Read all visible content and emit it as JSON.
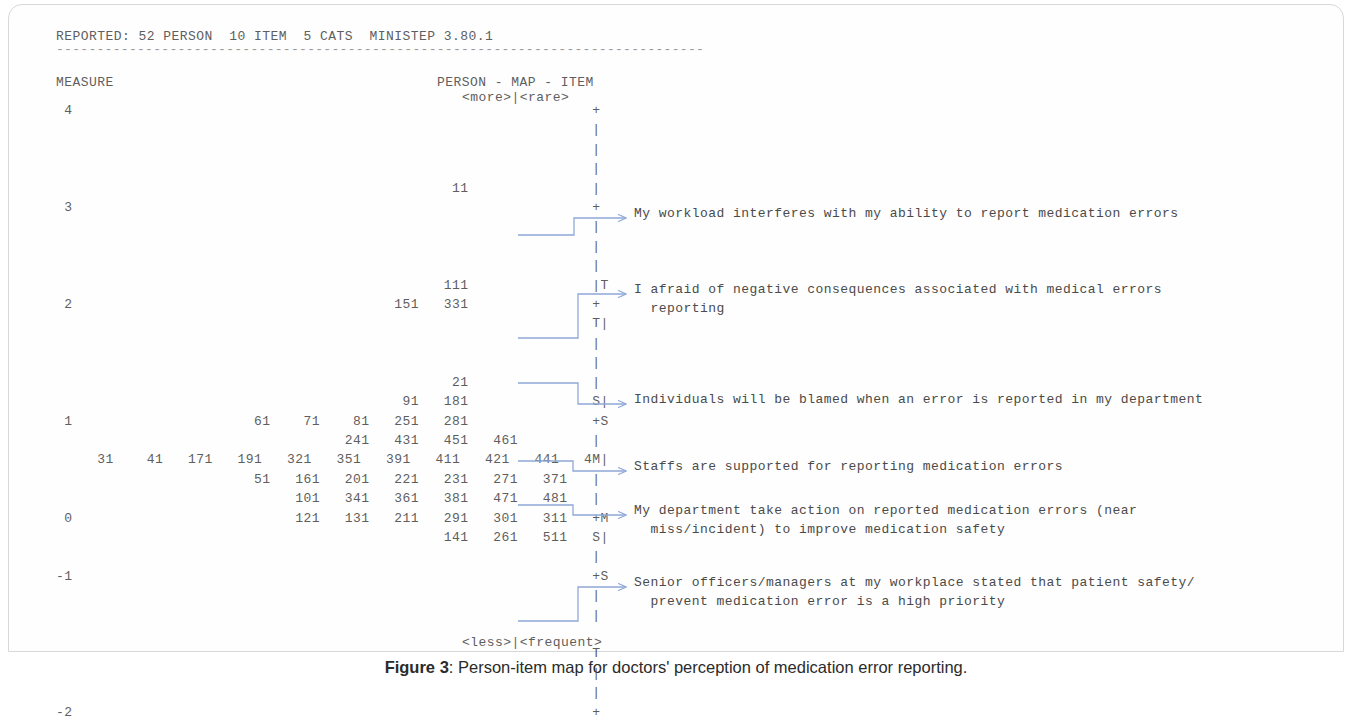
{
  "header": {
    "reported_line": "REPORTED: 52 PERSON  10 ITEM  5 CATS  MINISTEP 3.80.1",
    "rule": "--------------------------------------------------------------------------------",
    "measure_label": "MEASURE",
    "map_title": "PERSON - MAP - ITEM",
    "top_legend": "<more>|<rare>",
    "bottom_legend": "<less>|<frequent>"
  },
  "axis": {
    "ticks": [
      "4",
      "3",
      "2",
      "1",
      "0",
      "-1",
      "-2"
    ]
  },
  "connector_color": "#8fa8d8",
  "map_rows": [
    {
      "measure": "4",
      "persons": "",
      "marker": "+"
    },
    {
      "measure": "",
      "persons": "",
      "marker": "|"
    },
    {
      "measure": "",
      "persons": "",
      "marker": "|"
    },
    {
      "measure": "",
      "persons": "",
      "marker": "|"
    },
    {
      "measure": "",
      "persons": "                                             11",
      "marker": "|"
    },
    {
      "measure": "3",
      "persons": "",
      "marker": "+"
    },
    {
      "measure": "",
      "persons": "",
      "marker": "|"
    },
    {
      "measure": "",
      "persons": "",
      "marker": "|"
    },
    {
      "measure": "",
      "persons": "",
      "marker": "|"
    },
    {
      "measure": "",
      "persons": "                                            111",
      "marker": "|T"
    },
    {
      "measure": "2",
      "persons": "                                      151   331",
      "marker": "+"
    },
    {
      "measure": "",
      "persons": "",
      "marker": "T|"
    },
    {
      "measure": "",
      "persons": "",
      "marker": "|"
    },
    {
      "measure": "",
      "persons": "",
      "marker": "|"
    },
    {
      "measure": "",
      "persons": "                                             21",
      "marker": "|"
    },
    {
      "measure": "",
      "persons": "                                       91   181",
      "marker": "S|"
    },
    {
      "measure": "1",
      "persons": "                     61    71    81   251   281",
      "marker": "+S"
    },
    {
      "measure": "",
      "persons": "                                241   431   451   461",
      "marker": "|"
    },
    {
      "measure": "",
      "persons": "  31    41   171   191   321   351   391   411   421   441   491",
      "marker": "M|"
    },
    {
      "measure": "",
      "persons": "                     51   161   201   221   231   271   371   501",
      "marker": "|"
    },
    {
      "measure": "",
      "persons": "                          101   341   361   381   471   481   671",
      "marker": "|"
    },
    {
      "measure": "0",
      "persons": "                          121   131   211   291   301   311   401",
      "marker": "+M"
    },
    {
      "measure": "",
      "persons": "                                            141   261   511",
      "marker": "S|"
    },
    {
      "measure": "",
      "persons": "",
      "marker": "|"
    },
    {
      "measure": "-1",
      "persons": "",
      "marker": "+S"
    },
    {
      "measure": "",
      "persons": "",
      "marker": "|"
    },
    {
      "measure": "",
      "persons": "",
      "marker": "|"
    },
    {
      "measure": "",
      "persons": "",
      "marker": ""
    },
    {
      "measure": "",
      "persons": "",
      "marker": "T"
    },
    {
      "measure": "",
      "persons": "",
      "marker": "|"
    },
    {
      "measure": "",
      "persons": "",
      "marker": "|"
    },
    {
      "measure": "-2",
      "persons": "",
      "marker": "+"
    }
  ],
  "items": [
    {
      "id": "item-workload",
      "lines": [
        "My workload interferes with my ability to report medication errors"
      ]
    },
    {
      "id": "item-fear-consequences",
      "lines": [
        "I afraid of negative consequences associated with medical errors",
        "  reporting"
      ]
    },
    {
      "id": "item-blamed",
      "lines": [
        "Individuals will be blamed when an error is reported in my department"
      ]
    },
    {
      "id": "item-staff-supported",
      "lines": [
        "Staffs are supported for reporting medication errors"
      ]
    },
    {
      "id": "item-department-action",
      "lines": [
        "My department take action on reported medication errors (near",
        "  miss/incident) to improve medication safety"
      ]
    },
    {
      "id": "item-senior-officers",
      "lines": [
        "Senior officers/managers at my workplace stated that patient safety/",
        "  prevent medication error is a high priority"
      ]
    }
  ],
  "caption": {
    "label": "Figure 3",
    "separator": ": ",
    "text": "Person-item map for doctors' perception of medication error reporting."
  }
}
